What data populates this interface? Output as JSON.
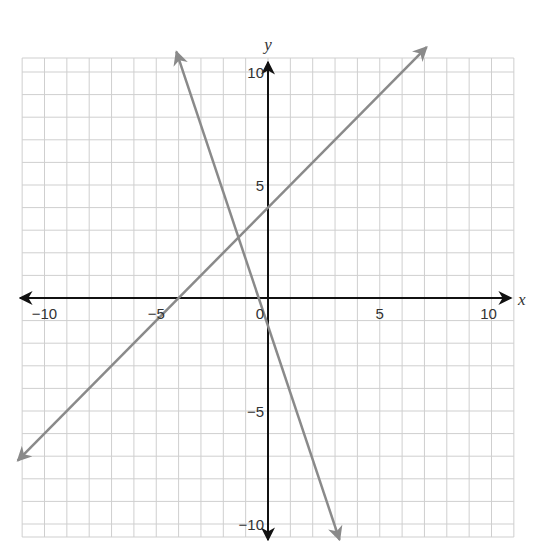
{
  "chart_data": {
    "type": "line",
    "title": "",
    "xlabel": "x",
    "ylabel": "y",
    "xlim": [
      -11,
      11
    ],
    "ylim": [
      -11,
      11
    ],
    "grid": true,
    "grid_step": 1,
    "x_ticks": [
      -10,
      -5,
      0,
      5,
      10
    ],
    "y_ticks": [
      10,
      5,
      -5,
      -10
    ],
    "x_tick_labels": [
      "−10",
      "−5",
      "0",
      "5",
      "10"
    ],
    "y_tick_labels": [
      "10",
      "5",
      "−5",
      "−10"
    ],
    "origin_label": "0",
    "series": [
      {
        "name": "line-1",
        "equation": "y = x + 4",
        "slope": 1,
        "intercept": 4,
        "endpoints": [
          [
            -11.2,
            -7.2
          ],
          [
            7.1,
            11.1
          ]
        ],
        "color": "#8a8a8a",
        "arrows": "both"
      },
      {
        "name": "line-2",
        "equation": "y = -3x - 1",
        "slope": -3,
        "intercept": -1,
        "endpoints": [
          [
            -4.1,
            10.9
          ],
          [
            3.2,
            -10.7
          ]
        ],
        "color": "#8a8a8a",
        "arrows": "both"
      }
    ],
    "intersection": [
      -1.25,
      2.75
    ]
  },
  "colors": {
    "axis": "#111111",
    "grid": "#cfcfcf",
    "lines": "#8a8a8a",
    "text": "#333333"
  }
}
